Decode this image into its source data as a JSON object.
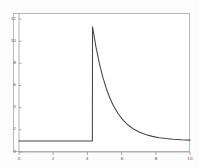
{
  "figure": {
    "background_color": "#fcfcfc",
    "plot_background_color": "#ffffff",
    "frame_color": "#b9b9b9",
    "line_color": "#444444"
  },
  "chart_data": {
    "type": "line",
    "title": "",
    "subtitle": "",
    "xlabel": "",
    "ylabel": "",
    "xlim": [
      0,
      10
    ],
    "ylim": [
      0,
      12
    ],
    "grid": false,
    "legend": null,
    "annotations": [],
    "xticks": [
      0,
      2,
      4,
      6,
      8,
      10
    ],
    "xtick_labels": [
      "0",
      "2",
      "4",
      "6",
      "8",
      "10"
    ],
    "yticks": [
      0,
      2,
      4,
      6,
      8,
      10,
      12
    ],
    "ytick_labels": [
      "0",
      "2",
      "4",
      "6",
      "8",
      "10",
      "12"
    ],
    "baseline_value": 1.0,
    "spike_x": 4.3,
    "peak_value": 11.3,
    "asymptote_value": 1.0,
    "decay_rate": 0.95,
    "series": [
      {
        "name": "response",
        "x": [
          0.0,
          0.5,
          1.0,
          1.5,
          2.0,
          2.5,
          3.0,
          3.5,
          4.0,
          4.29,
          4.3,
          4.5,
          4.7,
          4.9,
          5.1,
          5.3,
          5.5,
          5.8,
          6.1,
          6.4,
          6.7,
          7.0,
          7.4,
          7.8,
          8.2,
          8.6,
          9.0,
          9.5,
          10.0
        ],
        "y": [
          1.0,
          1.0,
          1.0,
          1.0,
          1.0,
          1.0,
          1.0,
          1.0,
          1.0,
          1.0,
          11.3,
          9.48,
          7.99,
          6.76,
          5.75,
          4.92,
          4.24,
          3.45,
          2.85,
          2.41,
          2.07,
          1.82,
          1.58,
          1.41,
          1.29,
          1.21,
          1.15,
          1.1,
          1.07
        ]
      }
    ]
  }
}
